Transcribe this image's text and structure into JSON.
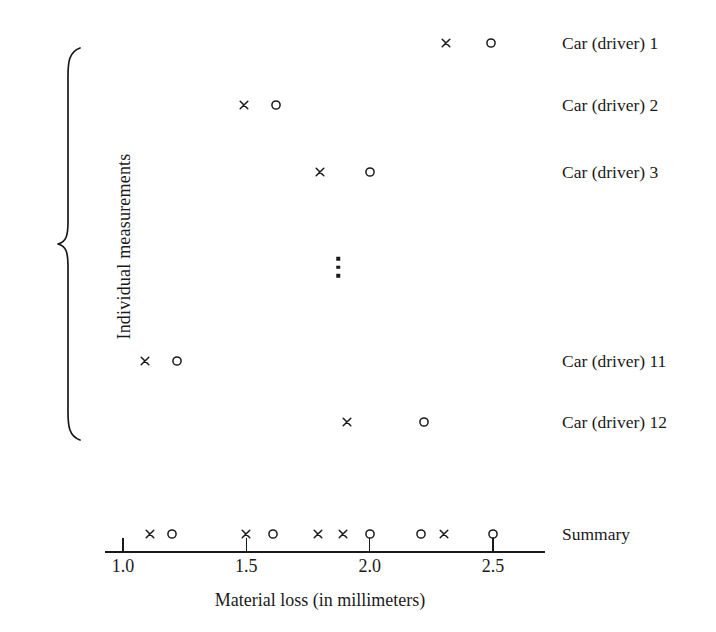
{
  "chart_data": {
    "type": "scatter",
    "title": "",
    "xlabel": "Material loss (in millimeters)",
    "ylabel": "Individual measurements",
    "xlim": [
      0.93,
      2.72
    ],
    "xticks": [
      1.0,
      1.5,
      2.0,
      2.5
    ],
    "xticklabels": [
      "1.0",
      "1.5",
      "2.0",
      "2.5"
    ],
    "grid": false,
    "legend_position": "none",
    "marker_symbols": {
      "cross": "x",
      "circle": "o"
    },
    "ellipsis_note": "vertical ellipsis indicating omitted rows 4 through 10",
    "rows": [
      {
        "label": "Car (driver) 1",
        "y_px": 43,
        "cross": 2.31,
        "circle": 2.49
      },
      {
        "label": "Car (driver) 2",
        "y_px": 105,
        "cross": 1.49,
        "circle": 1.62
      },
      {
        "label": "Car (driver) 3",
        "y_px": 172,
        "cross": 1.8,
        "circle": 2.0
      },
      {
        "label": "Car (driver) 11",
        "y_px": 361,
        "cross": 1.09,
        "circle": 1.22
      },
      {
        "label": "Car (driver) 12",
        "y_px": 422,
        "cross": 1.91,
        "circle": 2.22
      }
    ],
    "summary": {
      "label": "Summary",
      "y_px": 534,
      "crosses": [
        1.11,
        1.5,
        1.79,
        1.89,
        2.3
      ],
      "circles": [
        1.2,
        1.61,
        2.0,
        2.21,
        2.5
      ]
    }
  },
  "axis": {
    "title": "Material loss (in millimeters)",
    "ticks": [
      "1.0",
      "1.5",
      "2.0",
      "2.5"
    ]
  },
  "left_label": "Individual measurements",
  "row_labels": [
    "Car (driver) 1",
    "Car (driver) 2",
    "Car (driver) 3",
    "Car (driver) 11",
    "Car (driver) 12"
  ],
  "summary_label": "Summary",
  "colors": {
    "ink": "#1a1a1a",
    "background": "#ffffff"
  }
}
